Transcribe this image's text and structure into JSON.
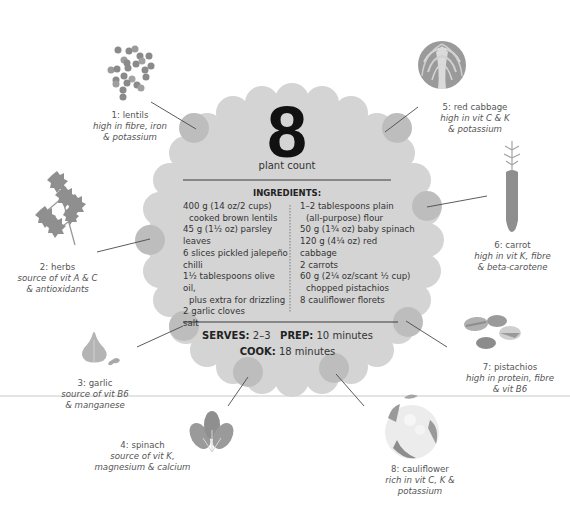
{
  "center": {
    "plant_count_number": "8",
    "plant_count_label": "plant count",
    "ingredients_title": "INGREDIENTS:",
    "ingredients_left": [
      {
        "text": "400 g (14 oz/2 cups)",
        "indent": false
      },
      {
        "text": "cooked brown lentils",
        "indent": true
      },
      {
        "text": "45 g (1½ oz) parsley leaves",
        "indent": false
      },
      {
        "text": "6 slices pickled jalepeño chilli",
        "indent": false
      },
      {
        "text": "1½ tablespoons olive oil,",
        "indent": false
      },
      {
        "text": "plus extra for drizzling",
        "indent": true
      },
      {
        "text": "2 garlic cloves",
        "indent": false
      },
      {
        "text": "salt",
        "indent": false
      }
    ],
    "ingredients_right": [
      {
        "text": "1–2 tablespoons plain",
        "indent": false
      },
      {
        "text": "(all-purpose) flour",
        "indent": true
      },
      {
        "text": "50 g (1¾ oz) baby spinach",
        "indent": false
      },
      {
        "text": "120 g (4¼ oz) red cabbage",
        "indent": false
      },
      {
        "text": "2 carrots",
        "indent": false
      },
      {
        "text": "60 g (2¼ oz/scant ½ cup)",
        "indent": false
      },
      {
        "text": "chopped pistachios",
        "indent": true
      },
      {
        "text": "8 cauliflower florets",
        "indent": false
      }
    ],
    "serves_label": "SERVES:",
    "serves_value": "2–3",
    "prep_label": "PREP:",
    "prep_value": "10 minutes",
    "cook_label": "COOK:",
    "cook_value": "18 minutes"
  },
  "plants": [
    {
      "name": "1: lentils",
      "desc": [
        "high in fibre, iron",
        "& potassium"
      ],
      "icon": "lentils-icon"
    },
    {
      "name": "2: herbs",
      "desc": [
        "source of vit A & C",
        "& antioxidants"
      ],
      "icon": "parsley-icon"
    },
    {
      "name": "3: garlic",
      "desc": [
        "source of vit B6",
        "& manganese"
      ],
      "icon": "garlic-icon"
    },
    {
      "name": "4: spinach",
      "desc": [
        "source of vit K,",
        "magnesium & calcium"
      ],
      "icon": "spinach-icon"
    },
    {
      "name": "5: red cabbage",
      "desc": [
        "high in vit C & K",
        "& potassium"
      ],
      "icon": "red-cabbage-icon"
    },
    {
      "name": "6: carrot",
      "desc": [
        "high in vit K, fibre",
        "& beta-carotene"
      ],
      "icon": "carrot-icon"
    },
    {
      "name": "7: pistachios",
      "desc": [
        "high in protein, fibre",
        "& vit B6"
      ],
      "icon": "pistachios-icon"
    },
    {
      "name": "8: cauliflower",
      "desc": [
        "rich in vit C, K &",
        "potassium"
      ],
      "icon": "cauliflower-icon"
    }
  ],
  "colors": {
    "scallop_fill": "#d4d4d4",
    "hub_fill": "#bdbdbd",
    "illustration_dark": "#8a8a8a",
    "illustration_mid": "#a8a8a8",
    "illustration_light": "#cfcfcf",
    "text": "#333333"
  }
}
